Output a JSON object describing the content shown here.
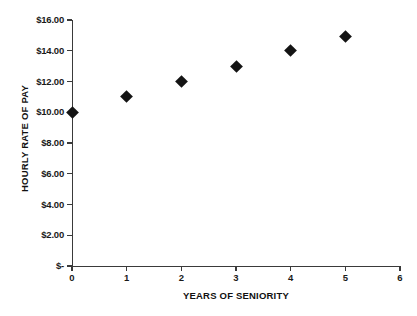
{
  "chart_data": {
    "type": "scatter",
    "title": "",
    "xlabel": "YEARS OF SENIORITY",
    "ylabel": "HOURLY RATE OF PAY",
    "x": [
      0,
      1,
      2,
      3,
      4,
      5
    ],
    "values": [
      10.0,
      11.0,
      12.0,
      13.0,
      14.0,
      14.9
    ],
    "series": [
      {
        "name": "Hourly Rate of Pay",
        "x": [
          0,
          1,
          2,
          3,
          4,
          5
        ],
        "values": [
          10.0,
          11.0,
          12.0,
          13.0,
          14.0,
          14.9
        ]
      }
    ],
    "xlim": [
      0,
      6
    ],
    "ylim": [
      0,
      16
    ],
    "x_ticks": [
      0,
      1,
      2,
      3,
      4,
      5,
      6
    ],
    "x_tick_labels": [
      "0",
      "1",
      "2",
      "3",
      "4",
      "5",
      "6"
    ],
    "y_ticks": [
      0,
      2,
      4,
      6,
      8,
      10,
      12,
      14,
      16
    ],
    "y_tick_labels": [
      "$-",
      "$2.00",
      "$4.00",
      "$6.00",
      "$8.00",
      "$10.00",
      "$12.00",
      "$14.00",
      "$16.00"
    ],
    "grid": false,
    "legend": false,
    "legend_position": "none",
    "marker_shape": "diamond",
    "marker_color": "#141414",
    "axis_color": "#3a3a3a",
    "background_color": "#ffffff"
  }
}
